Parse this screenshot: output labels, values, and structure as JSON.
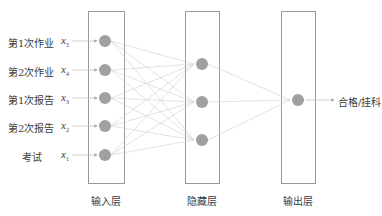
{
  "inputs": [
    {
      "label": "第1次作业",
      "var": "x",
      "sub": "5"
    },
    {
      "label": "第2次作业",
      "var": "x",
      "sub": "4"
    },
    {
      "label": "第1次报告",
      "var": "x",
      "sub": "3"
    },
    {
      "label": "第2次报告",
      "var": "x",
      "sub": "2"
    },
    {
      "label": "考试",
      "var": "x",
      "sub": "1"
    }
  ],
  "layers": {
    "input": "输入层",
    "hidden": "隐藏层",
    "output": "输出层"
  },
  "output_label": "合格/挂科",
  "colors": {
    "node": "#a0a0a0",
    "edge": "#c8c8c8",
    "box": "#999999"
  }
}
